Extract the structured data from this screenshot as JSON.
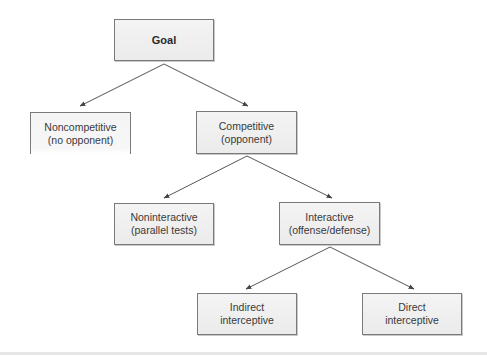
{
  "diagram": {
    "nodes": [
      {
        "id": "goal",
        "lines": [
          "Goal"
        ]
      },
      {
        "id": "noncompetitive",
        "lines": [
          "Noncompetitive",
          "(no opponent)"
        ]
      },
      {
        "id": "competitive",
        "lines": [
          "Competitive",
          "(opponent)"
        ]
      },
      {
        "id": "noninteractive",
        "lines": [
          "Noninteractive",
          "(parallel tests)"
        ]
      },
      {
        "id": "interactive",
        "lines": [
          "Interactive",
          "(offense/defense)"
        ]
      },
      {
        "id": "indirect",
        "lines": [
          "Indirect",
          "interceptive"
        ]
      },
      {
        "id": "direct",
        "lines": [
          "Direct",
          "interceptive"
        ]
      }
    ],
    "edges": [
      {
        "from": "goal",
        "to": "noncompetitive"
      },
      {
        "from": "goal",
        "to": "competitive"
      },
      {
        "from": "competitive",
        "to": "noninteractive"
      },
      {
        "from": "competitive",
        "to": "interactive"
      },
      {
        "from": "interactive",
        "to": "indirect"
      },
      {
        "from": "interactive",
        "to": "direct"
      }
    ],
    "line_color": "#555555"
  }
}
